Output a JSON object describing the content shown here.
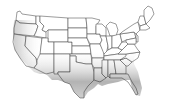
{
  "map": {
    "title": "",
    "region": "Contiguous United States",
    "style": "state outlines with gray shading",
    "colors": {
      "background": "#ffffff",
      "state_fill": "#ffffff",
      "state_border": "#4a4a4a",
      "shade_dark": "#8a8a8a",
      "shade_light": "#ffffff"
    },
    "shaded_regions": [
      "California coast",
      "Nevada (southern)",
      "Arizona",
      "New Mexico",
      "Texas",
      "Oklahoma (southern)",
      "Louisiana",
      "Arkansas",
      "Mississippi",
      "Alabama",
      "Georgia",
      "Florida",
      "South Carolina",
      "North Carolina",
      "Tennessee",
      "Virginia (eastern)",
      "Oregon (western)"
    ],
    "legend": []
  }
}
